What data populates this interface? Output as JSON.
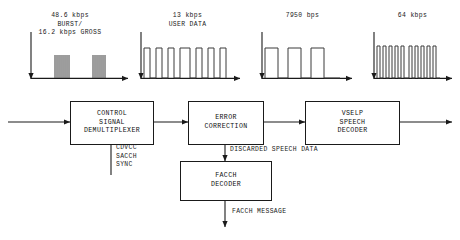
{
  "diagram": {
    "stroke_color": "#1a1a1a",
    "background_color": "#ffffff",
    "waveform_color": "#3a3a3a"
  },
  "waveforms": [
    {
      "id": "burst-waveform",
      "label": "48.6 kbps\nBURST/\n16.2 kbps GROSS",
      "label_lines": [
        "48.6 kbps",
        "BURST/",
        "16.2 kbps GROSS"
      ],
      "type": "burst-packets",
      "description": "Two dense vertical line burst clusters on a time axis",
      "rate_value": "48.6",
      "rate_unit": "kbps"
    },
    {
      "id": "user-data-waveform",
      "label": "13 kbps\nUSER DATA",
      "label_lines": [
        "13 kbps",
        "USER DATA"
      ],
      "type": "square-pulse-train",
      "description": "Irregular digital square wave pulse train",
      "rate_value": "13",
      "rate_unit": "kbps"
    },
    {
      "id": "speech-rate-waveform",
      "label": "7950 bps",
      "label_lines": [
        "7950 bps"
      ],
      "type": "square-pulse-train",
      "description": "Three wide square pulses",
      "rate_value": "7950",
      "rate_unit": "bps"
    },
    {
      "id": "pcm-audio-waveform",
      "label": "64 kbps",
      "label_lines": [
        "64 kbps"
      ],
      "type": "dense-pulse-train",
      "description": "Dense high frequency square pulse train",
      "rate_value": "64",
      "rate_unit": "kbps"
    }
  ],
  "blocks": [
    {
      "id": "control-signal-demultiplexer",
      "label_lines": [
        "CONTROL",
        "SIGNAL",
        "DEMULTIPLEXER"
      ]
    },
    {
      "id": "error-correction",
      "label_lines": [
        "ERROR",
        "CORRECTION"
      ]
    },
    {
      "id": "vselp-speech-decoder",
      "label_lines": [
        "VSELP",
        "SPEECH",
        "DECODER"
      ]
    },
    {
      "id": "facch-decoder",
      "label_lines": [
        "FACCH",
        "DECODER"
      ]
    }
  ],
  "flow_labels": {
    "demux_outputs": "CDVCC\nSACCH\nSYNC",
    "demux_outputs_lines": [
      "CDVCC",
      "SACCH",
      "SYNC"
    ],
    "discarded_speech": "DISCARDED SPEECH DATA",
    "facch_message": "FACCH MESSAGE"
  }
}
